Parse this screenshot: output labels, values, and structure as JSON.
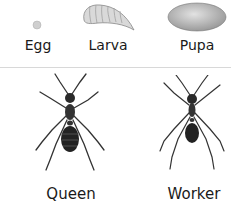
{
  "stages": [
    {
      "label": "Egg"
    },
    {
      "label": "Larva"
    },
    {
      "label": "Pupa"
    }
  ],
  "castes": [
    {
      "label": "Queen"
    },
    {
      "label": "Worker"
    }
  ]
}
